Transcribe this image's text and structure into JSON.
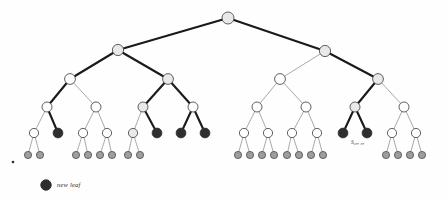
{
  "figure": {
    "background": "#fefefe"
  },
  "colors": {
    "internal_fill": "#ffffff",
    "shaded_fill": "#e9e9e9",
    "leaf_fill": "#9e9e9e",
    "new_leaf_fill": "#2e2e2e",
    "stroke": "#3a3a3a",
    "edge_thin": "#6f6f6f",
    "edge_thick": "#1a1a1a"
  },
  "legend": {
    "marker_name": "new-leaf-marker",
    "label": "new leaf"
  },
  "annotations": [
    {
      "name": "node-label-s",
      "text": "S₉₈, ₅₈",
      "x": 351,
      "y": 139
    }
  ],
  "tree": {
    "levels": [
      18,
      50,
      79,
      107,
      133,
      155
    ],
    "radius": {
      "r0": 6.0,
      "r1": 5.6,
      "r2": 5.4,
      "r3": 5.0,
      "r4": 4.6,
      "r5": 3.6
    },
    "nodes": [
      {
        "id": "n0",
        "x": 228,
        "y": 18,
        "r": 6.0,
        "kind": "shaded"
      },
      {
        "id": "n1L",
        "x": 118,
        "y": 50,
        "r": 5.6,
        "kind": "shaded"
      },
      {
        "id": "n1R",
        "x": 325,
        "y": 51,
        "r": 5.6,
        "kind": "shaded"
      },
      {
        "id": "n2a",
        "x": 70,
        "y": 79,
        "r": 5.4,
        "kind": "plain"
      },
      {
        "id": "n2b",
        "x": 168,
        "y": 79,
        "r": 5.4,
        "kind": "shaded"
      },
      {
        "id": "n2c",
        "x": 280,
        "y": 79,
        "r": 5.4,
        "kind": "plain"
      },
      {
        "id": "n2d",
        "x": 378,
        "y": 79,
        "r": 5.4,
        "kind": "shaded"
      },
      {
        "id": "n3a",
        "x": 47,
        "y": 107,
        "r": 5.0,
        "kind": "plain"
      },
      {
        "id": "n3b",
        "x": 96,
        "y": 107,
        "r": 5.0,
        "kind": "plain"
      },
      {
        "id": "n3c",
        "x": 143,
        "y": 107,
        "r": 5.0,
        "kind": "shaded"
      },
      {
        "id": "n3d",
        "x": 193,
        "y": 107,
        "r": 5.0,
        "kind": "plain"
      },
      {
        "id": "n3e",
        "x": 257,
        "y": 107,
        "r": 5.0,
        "kind": "plain"
      },
      {
        "id": "n3f",
        "x": 306,
        "y": 107,
        "r": 5.0,
        "kind": "plain"
      },
      {
        "id": "n3g",
        "x": 355,
        "y": 107,
        "r": 5.0,
        "kind": "shaded"
      },
      {
        "id": "n3h",
        "x": 404,
        "y": 107,
        "r": 5.0,
        "kind": "plain"
      },
      {
        "id": "n4a",
        "x": 34,
        "y": 133,
        "r": 4.6,
        "kind": "plain"
      },
      {
        "id": "n4b",
        "x": 58,
        "y": 133,
        "r": 4.9,
        "kind": "new"
      },
      {
        "id": "n4c",
        "x": 83,
        "y": 133,
        "r": 4.6,
        "kind": "plain"
      },
      {
        "id": "n4d",
        "x": 107,
        "y": 133,
        "r": 4.6,
        "kind": "plain"
      },
      {
        "id": "n4e",
        "x": 133,
        "y": 133,
        "r": 4.6,
        "kind": "shaded"
      },
      {
        "id": "n4f",
        "x": 157,
        "y": 133,
        "r": 4.9,
        "kind": "new"
      },
      {
        "id": "n4g",
        "x": 181,
        "y": 133,
        "r": 4.9,
        "kind": "new"
      },
      {
        "id": "n4h",
        "x": 205,
        "y": 133,
        "r": 4.9,
        "kind": "new"
      },
      {
        "id": "n4i",
        "x": 244,
        "y": 133,
        "r": 4.6,
        "kind": "plain"
      },
      {
        "id": "n4j",
        "x": 268,
        "y": 133,
        "r": 4.6,
        "kind": "plain"
      },
      {
        "id": "n4k",
        "x": 292,
        "y": 133,
        "r": 4.6,
        "kind": "plain"
      },
      {
        "id": "n4l",
        "x": 317,
        "y": 133,
        "r": 4.6,
        "kind": "plain"
      },
      {
        "id": "n4m",
        "x": 343,
        "y": 133,
        "r": 4.9,
        "kind": "new"
      },
      {
        "id": "n4n",
        "x": 367,
        "y": 133,
        "r": 4.9,
        "kind": "new"
      },
      {
        "id": "n4o",
        "x": 392,
        "y": 133,
        "r": 4.6,
        "kind": "plain"
      },
      {
        "id": "n4p",
        "x": 416,
        "y": 133,
        "r": 4.6,
        "kind": "plain"
      },
      {
        "id": "l1",
        "x": 28,
        "y": 155,
        "r": 3.6,
        "kind": "leaf"
      },
      {
        "id": "l2",
        "x": 40,
        "y": 155,
        "r": 3.6,
        "kind": "leaf"
      },
      {
        "id": "l3",
        "x": 76,
        "y": 155,
        "r": 3.6,
        "kind": "leaf"
      },
      {
        "id": "l4",
        "x": 88,
        "y": 155,
        "r": 3.6,
        "kind": "leaf"
      },
      {
        "id": "l5",
        "x": 100,
        "y": 155,
        "r": 3.6,
        "kind": "leaf"
      },
      {
        "id": "l6",
        "x": 112,
        "y": 155,
        "r": 3.6,
        "kind": "leaf"
      },
      {
        "id": "l7",
        "x": 128,
        "y": 155,
        "r": 3.6,
        "kind": "leaf"
      },
      {
        "id": "l8",
        "x": 140,
        "y": 155,
        "r": 3.6,
        "kind": "leaf"
      },
      {
        "id": "l9",
        "x": 238,
        "y": 155,
        "r": 3.6,
        "kind": "leaf"
      },
      {
        "id": "l10",
        "x": 250,
        "y": 155,
        "r": 3.6,
        "kind": "leaf"
      },
      {
        "id": "l11",
        "x": 262,
        "y": 155,
        "r": 3.6,
        "kind": "leaf"
      },
      {
        "id": "l12",
        "x": 274,
        "y": 155,
        "r": 3.6,
        "kind": "leaf"
      },
      {
        "id": "l13",
        "x": 287,
        "y": 155,
        "r": 3.6,
        "kind": "leaf"
      },
      {
        "id": "l14",
        "x": 299,
        "y": 155,
        "r": 3.6,
        "kind": "leaf"
      },
      {
        "id": "l15",
        "x": 311,
        "y": 155,
        "r": 3.6,
        "kind": "leaf"
      },
      {
        "id": "l16",
        "x": 323,
        "y": 155,
        "r": 3.6,
        "kind": "leaf"
      },
      {
        "id": "l17",
        "x": 386,
        "y": 155,
        "r": 3.6,
        "kind": "leaf"
      },
      {
        "id": "l18",
        "x": 398,
        "y": 155,
        "r": 3.6,
        "kind": "leaf"
      },
      {
        "id": "l19",
        "x": 410,
        "y": 155,
        "r": 3.6,
        "kind": "leaf"
      },
      {
        "id": "l20",
        "x": 422,
        "y": 155,
        "r": 3.6,
        "kind": "leaf"
      }
    ],
    "edges": [
      {
        "from": "n0",
        "to": "n1L",
        "weight": "thick"
      },
      {
        "from": "n0",
        "to": "n1R",
        "weight": "thick"
      },
      {
        "from": "n1L",
        "to": "n2a",
        "weight": "thick"
      },
      {
        "from": "n1L",
        "to": "n2b",
        "weight": "thick"
      },
      {
        "from": "n1R",
        "to": "n2c",
        "weight": "thin"
      },
      {
        "from": "n1R",
        "to": "n2d",
        "weight": "thick"
      },
      {
        "from": "n2a",
        "to": "n3a",
        "weight": "thick"
      },
      {
        "from": "n2a",
        "to": "n3b",
        "weight": "thin"
      },
      {
        "from": "n2b",
        "to": "n3c",
        "weight": "thick"
      },
      {
        "from": "n2b",
        "to": "n3d",
        "weight": "thick"
      },
      {
        "from": "n2c",
        "to": "n3e",
        "weight": "thin"
      },
      {
        "from": "n2c",
        "to": "n3f",
        "weight": "thin"
      },
      {
        "from": "n2d",
        "to": "n3g",
        "weight": "thick"
      },
      {
        "from": "n2d",
        "to": "n3h",
        "weight": "thin"
      },
      {
        "from": "n3a",
        "to": "n4a",
        "weight": "thin"
      },
      {
        "from": "n3a",
        "to": "n4b",
        "weight": "thick"
      },
      {
        "from": "n3b",
        "to": "n4c",
        "weight": "thin"
      },
      {
        "from": "n3b",
        "to": "n4d",
        "weight": "thin"
      },
      {
        "from": "n3c",
        "to": "n4e",
        "weight": "thin"
      },
      {
        "from": "n3c",
        "to": "n4f",
        "weight": "thick"
      },
      {
        "from": "n3d",
        "to": "n4g",
        "weight": "thick"
      },
      {
        "from": "n3d",
        "to": "n4h",
        "weight": "thick"
      },
      {
        "from": "n3e",
        "to": "n4i",
        "weight": "thin"
      },
      {
        "from": "n3e",
        "to": "n4j",
        "weight": "thin"
      },
      {
        "from": "n3f",
        "to": "n4k",
        "weight": "thin"
      },
      {
        "from": "n3f",
        "to": "n4l",
        "weight": "thin"
      },
      {
        "from": "n3g",
        "to": "n4m",
        "weight": "thick"
      },
      {
        "from": "n3g",
        "to": "n4n",
        "weight": "thick"
      },
      {
        "from": "n3h",
        "to": "n4o",
        "weight": "thin"
      },
      {
        "from": "n3h",
        "to": "n4p",
        "weight": "thin"
      },
      {
        "from": "n4a",
        "to": "l1",
        "weight": "thin"
      },
      {
        "from": "n4a",
        "to": "l2",
        "weight": "thin"
      },
      {
        "from": "n4c",
        "to": "l3",
        "weight": "thin"
      },
      {
        "from": "n4c",
        "to": "l4",
        "weight": "thin"
      },
      {
        "from": "n4d",
        "to": "l5",
        "weight": "thin"
      },
      {
        "from": "n4d",
        "to": "l6",
        "weight": "thin"
      },
      {
        "from": "n4e",
        "to": "l7",
        "weight": "thin"
      },
      {
        "from": "n4e",
        "to": "l8",
        "weight": "thin"
      },
      {
        "from": "n4i",
        "to": "l9",
        "weight": "thin"
      },
      {
        "from": "n4i",
        "to": "l10",
        "weight": "thin"
      },
      {
        "from": "n4j",
        "to": "l11",
        "weight": "thin"
      },
      {
        "from": "n4j",
        "to": "l12",
        "weight": "thin"
      },
      {
        "from": "n4k",
        "to": "l13",
        "weight": "thin"
      },
      {
        "from": "n4k",
        "to": "l14",
        "weight": "thin"
      },
      {
        "from": "n4l",
        "to": "l15",
        "weight": "thin"
      },
      {
        "from": "n4l",
        "to": "l16",
        "weight": "thin"
      },
      {
        "from": "n4o",
        "to": "l17",
        "weight": "thin"
      },
      {
        "from": "n4o",
        "to": "l18",
        "weight": "thin"
      },
      {
        "from": "n4p",
        "to": "l19",
        "weight": "thin"
      },
      {
        "from": "n4p",
        "to": "l20",
        "weight": "thin"
      }
    ]
  },
  "stray_dot": {
    "name": "stray-dot",
    "x": 13,
    "y": 162,
    "r": 1.3
  },
  "legend_marker": {
    "x": 46,
    "y": 185,
    "r": 5.2
  },
  "legend_text_pos": {
    "x": 57,
    "y": 181
  }
}
